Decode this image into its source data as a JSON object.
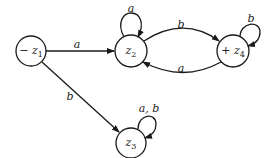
{
  "diagram": {
    "type": "finite-automaton",
    "states": [
      {
        "id": "z1",
        "label": "− z",
        "sub": "1",
        "start": true,
        "final": false
      },
      {
        "id": "z2",
        "label": "z",
        "sub": "2",
        "start": false,
        "final": false
      },
      {
        "id": "z3",
        "label": "z",
        "sub": "3",
        "start": false,
        "final": false
      },
      {
        "id": "z4",
        "label": "+ z",
        "sub": "4",
        "start": false,
        "final": true
      }
    ],
    "transitions": [
      {
        "from": "z1",
        "to": "z2",
        "label": "a"
      },
      {
        "from": "z1",
        "to": "z3",
        "label": "b"
      },
      {
        "from": "z2",
        "to": "z2",
        "label": "a"
      },
      {
        "from": "z2",
        "to": "z4",
        "label": "b"
      },
      {
        "from": "z4",
        "to": "z2",
        "label": "a"
      },
      {
        "from": "z4",
        "to": "z4",
        "label": "b"
      },
      {
        "from": "z3",
        "to": "z3",
        "label": "a, b"
      }
    ],
    "colors": {
      "stroke": "#1a1a1a",
      "background": "#ffffff"
    }
  }
}
